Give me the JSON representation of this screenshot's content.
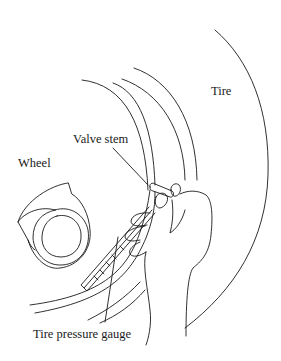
{
  "diagram": {
    "type": "technical-illustration",
    "line_color": "#1a1a1a",
    "background": "#ffffff",
    "labels": {
      "tire": "Tire",
      "wheel": "Wheel",
      "valve_stem": "Valve stem",
      "gauge": "Tire pressure gauge"
    }
  }
}
